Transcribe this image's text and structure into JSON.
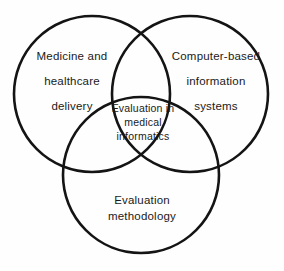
{
  "diagram": {
    "type": "venn",
    "background_color": "#fefefe",
    "stroke_color": "#141414",
    "sets": [
      {
        "id": "medicine-healthcare",
        "position": "left",
        "lines": [
          "Medicine and",
          "healthcare",
          "delivery"
        ],
        "center": {
          "x": 92,
          "y": 94
        },
        "radius": 78
      },
      {
        "id": "computer-based-information-systems",
        "position": "right",
        "lines": [
          "Computer-based",
          "information",
          "systems"
        ],
        "center": {
          "x": 190,
          "y": 94
        },
        "radius": 78
      },
      {
        "id": "evaluation-methodology",
        "position": "bottom",
        "lines": [
          "Evaluation",
          "methodology"
        ],
        "center": {
          "x": 141,
          "y": 175
        },
        "radius": 78
      }
    ],
    "intersection": {
      "id": "evaluation-in-medical-informatics",
      "lines": [
        "Evaluation in",
        "medical",
        "informatics"
      ]
    }
  },
  "chart_data": {
    "type": "diagram",
    "title": "Evaluation in medical informatics",
    "categories": [
      "Medicine and healthcare delivery",
      "Computer-based information systems",
      "Evaluation methodology"
    ],
    "center_label": "Evaluation in medical informatics",
    "legend": "none",
    "grid": false
  }
}
